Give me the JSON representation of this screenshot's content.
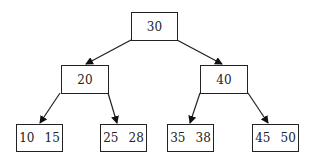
{
  "tree": {
    "root": {
      "keys": [
        "30"
      ]
    },
    "left": {
      "keys": [
        "20"
      ]
    },
    "right": {
      "keys": [
        "40"
      ]
    },
    "leaves": [
      {
        "keys": [
          "10",
          "15"
        ]
      },
      {
        "keys": [
          "25",
          "28"
        ]
      },
      {
        "keys": [
          "35",
          "38"
        ]
      },
      {
        "keys": [
          "45",
          "50"
        ]
      }
    ]
  }
}
